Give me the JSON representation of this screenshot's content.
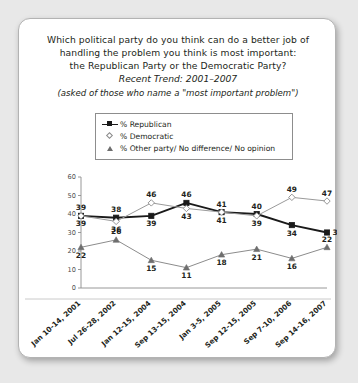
{
  "card": {
    "title_lines": [
      "Which political party do you think can do a better job of",
      "handling the problem you think is most important:",
      "the Republican Party or the Democratic Party?"
    ],
    "trend_line": "Recent Trend: 2001–2007",
    "note_line": "(asked of those who name a \"most important problem\")"
  },
  "legend": {
    "items": [
      {
        "label": "% Republican",
        "marker": "square-filled",
        "color": "#1a1a1a"
      },
      {
        "label": "% Democratic",
        "marker": "diamond-hollow",
        "color": "#9a9a9a"
      },
      {
        "label": "% Other party/ No difference/ No opinion",
        "marker": "triangle",
        "color": "#8c8c8c"
      }
    ]
  },
  "chart_data": {
    "type": "line",
    "title": "Which political party do you think can do a better job of handling the problem you think is most important: the Republican Party or the Democratic Party?",
    "subtitle": "Recent Trend: 2001–2007",
    "xlabel": "",
    "ylabel": "",
    "ylim": [
      0,
      60
    ],
    "yticks": [
      0,
      10,
      20,
      30,
      40,
      50,
      60
    ],
    "grid": false,
    "legend_position": "above-plot",
    "categories": [
      "Jan 10-14, 2001",
      "Jul 26-28, 2002",
      "Jan 12-15, 2004",
      "Sep 13-15, 2004",
      "Jan 3-5, 2005",
      "Sep 12-15, 2005",
      "Sep 7-10, 2006",
      "Sep 14-16, 2007"
    ],
    "series": [
      {
        "name": "% Republican",
        "color": "#1a1a1a",
        "marker": "square-filled",
        "values": [
          39,
          38,
          39,
          46,
          41,
          40,
          34,
          30
        ]
      },
      {
        "name": "% Democratic",
        "color": "#9a9a9a",
        "marker": "diamond-hollow",
        "values": [
          39,
          36,
          46,
          43,
          41,
          39,
          49,
          47
        ]
      },
      {
        "name": "% Other party/ No difference/ No opinion",
        "color": "#8c8c8c",
        "marker": "triangle",
        "values": [
          22,
          26,
          15,
          11,
          18,
          21,
          16,
          22
        ]
      }
    ]
  }
}
